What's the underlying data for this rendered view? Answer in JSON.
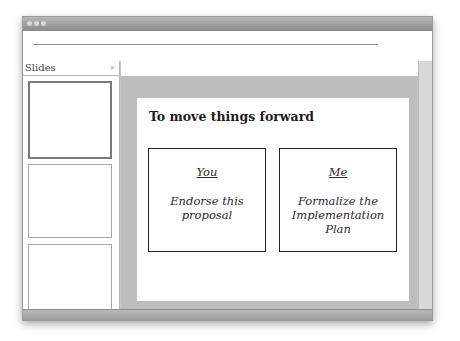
{
  "window": {
    "titlebar_buttons": [
      "close",
      "minimize",
      "zoom"
    ]
  },
  "sidebar": {
    "title": "Slides",
    "close_glyph": "×",
    "thumbnails": [
      {
        "index": 1,
        "selected": true
      },
      {
        "index": 2,
        "selected": false
      },
      {
        "index": 3,
        "selected": false
      }
    ]
  },
  "slide": {
    "title": "To move things forward",
    "boxes": [
      {
        "heading": "You",
        "body": "Endorse this proposal"
      },
      {
        "heading": "Me",
        "body": "Formalize the Implementation Plan"
      }
    ]
  },
  "colors": {
    "canvas_bg": "#bdbdbd",
    "titlebar": "#9a9a9a",
    "box_border": "#222222"
  }
}
